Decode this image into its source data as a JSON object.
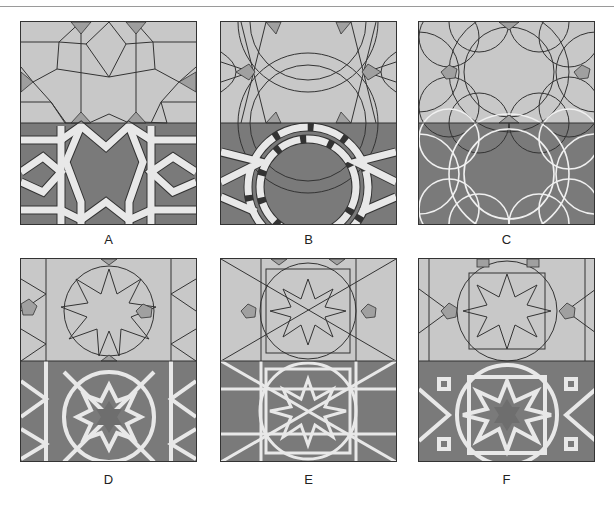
{
  "header": {
    "cut_off_text": ""
  },
  "colors": {
    "light_fill": "#c8c8c8",
    "dark_fill": "#7a7a7a",
    "ribbon": "#e8e8e8",
    "line": "#333333",
    "accent_fill": "#a0a0a0"
  },
  "panels": [
    {
      "id": "A",
      "label": "A",
      "pattern": "10-fold star rosette, interlaced ribbons"
    },
    {
      "id": "B",
      "label": "B",
      "pattern": "10-fold rosette, twisted braided ribbons"
    },
    {
      "id": "C",
      "label": "C",
      "pattern": "curved petal rosette, white outline lines"
    },
    {
      "id": "D",
      "label": "D",
      "pattern": "12-pointed star, white strapwork"
    },
    {
      "id": "E",
      "label": "E",
      "pattern": "12-pointed star, dense interlaced strapwork"
    },
    {
      "id": "F",
      "label": "F",
      "pattern": "12-pointed star with square knots, white strapwork"
    }
  ]
}
